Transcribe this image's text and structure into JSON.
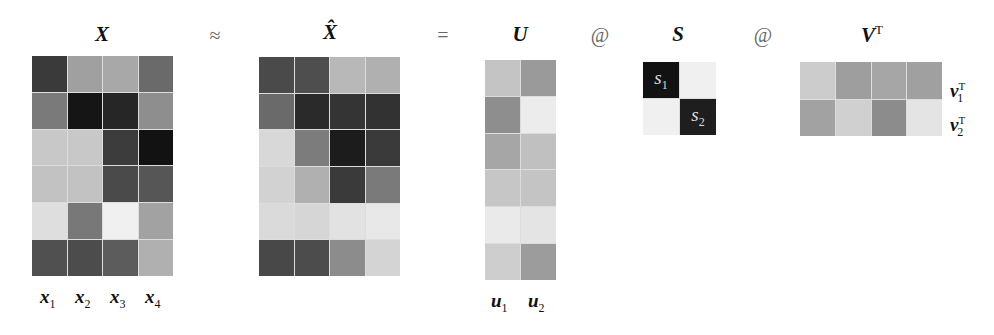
{
  "equation": {
    "op_approx": "≈",
    "op_equals": "=",
    "op_matmul_1": "@",
    "op_matmul_2": "@"
  },
  "matrices": {
    "X": {
      "label": "X",
      "rows": 6,
      "cols": 4,
      "cells": [
        [
          "#3a3a3a",
          "#a0a0a0",
          "#a8a8a8",
          "#6a6a6a"
        ],
        [
          "#7a7a7a",
          "#151515",
          "#262626",
          "#8e8e8e"
        ],
        [
          "#c8c8c8",
          "#c8c8c8",
          "#3c3c3c",
          "#121212"
        ],
        [
          "#c2c2c2",
          "#c2c2c2",
          "#4a4a4a",
          "#565656"
        ],
        [
          "#dedede",
          "#787878",
          "#f0f0f0",
          "#a2a2a2"
        ],
        [
          "#505050",
          "#4c4c4c",
          "#5c5c5c",
          "#b0b0b0"
        ]
      ],
      "column_labels": [
        "x",
        "x",
        "x",
        "x"
      ],
      "column_subscripts": [
        "1",
        "2",
        "3",
        "4"
      ]
    },
    "X_hat": {
      "label": "X̂",
      "rows": 6,
      "cols": 4,
      "cells": [
        [
          "#4a4a4a",
          "#4e4e4e",
          "#b8b8b8",
          "#b0b0b0"
        ],
        [
          "#6a6a6a",
          "#2a2a2a",
          "#343434",
          "#323232"
        ],
        [
          "#d8d8d8",
          "#7c7c7c",
          "#1c1c1c",
          "#3a3a3a"
        ],
        [
          "#d2d2d2",
          "#b0b0b0",
          "#3a3a3a",
          "#7a7a7a"
        ],
        [
          "#dadada",
          "#d6d6d6",
          "#e2e2e2",
          "#e8e8e8"
        ],
        [
          "#484848",
          "#4c4c4c",
          "#8c8c8c",
          "#d4d4d4"
        ]
      ]
    },
    "U": {
      "label": "U",
      "rows": 6,
      "cols": 2,
      "cells": [
        [
          "#c4c4c4",
          "#9a9a9a"
        ],
        [
          "#8e8e8e",
          "#ececec"
        ],
        [
          "#a6a6a6",
          "#c0c0c0"
        ],
        [
          "#c6c6c6",
          "#c4c4c4"
        ],
        [
          "#eaeaea",
          "#e4e4e4"
        ],
        [
          "#cecece",
          "#9c9c9c"
        ]
      ],
      "column_labels": [
        "u",
        "u"
      ],
      "column_subscripts": [
        "1",
        "2"
      ]
    },
    "S": {
      "label": "S",
      "rows": 2,
      "cols": 2,
      "cells": [
        [
          "#121212",
          "#f0f0f0"
        ],
        [
          "#f0f0f0",
          "#1e1e1e"
        ]
      ],
      "diag_labels": [
        "s",
        "s"
      ],
      "diag_subscripts": [
        "1",
        "2"
      ]
    },
    "VT": {
      "label": "V",
      "label_sup": "T",
      "rows": 2,
      "cols": 4,
      "cells": [
        [
          "#cccccc",
          "#9e9e9e",
          "#a6a6a6",
          "#a0a0a0"
        ],
        [
          "#a2a2a2",
          "#d0d0d0",
          "#8c8c8c",
          "#e4e4e4"
        ]
      ],
      "row_labels": [
        "v",
        "v"
      ],
      "row_subscripts": [
        "1",
        "2"
      ],
      "row_superscripts": [
        "T",
        "T"
      ]
    }
  }
}
